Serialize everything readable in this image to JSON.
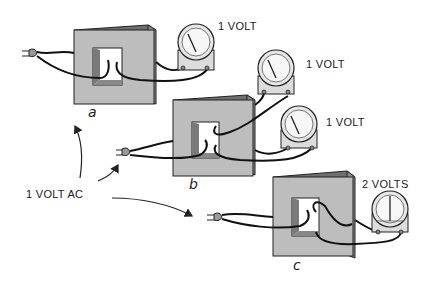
{
  "diagram": {
    "type": "transformer-voltage-demonstration",
    "source_label": "1 VOLT AC",
    "panels": [
      {
        "id": "a",
        "caption": "a",
        "meters": [
          {
            "reading": "1 VOLT",
            "needle": "mid"
          }
        ]
      },
      {
        "id": "b",
        "caption": "b",
        "meters": [
          {
            "reading": "1 VOLT",
            "needle": "mid"
          },
          {
            "reading": "1 VOLT",
            "needle": "mid"
          }
        ]
      },
      {
        "id": "c",
        "caption": "c",
        "meters": [
          {
            "reading": "2 VOLTS",
            "needle": "full"
          }
        ]
      }
    ],
    "colors": {
      "core_face": "#bdbdbd",
      "core_side": "#8a8a8a",
      "core_top": "#6f6f6f",
      "window_inner": "#7a7a7a",
      "meter_face": "#f2f2f2",
      "wire": "#111111"
    }
  }
}
